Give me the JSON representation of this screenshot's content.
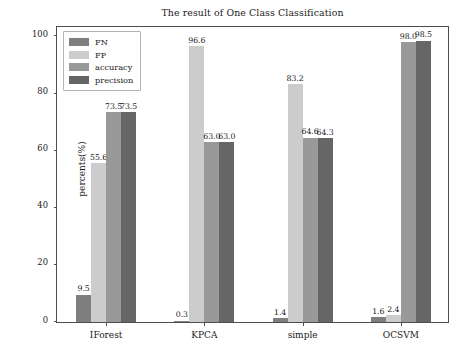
{
  "chart_data": {
    "type": "bar",
    "title": "The result of One Class Classification",
    "xlabel": "",
    "ylabel": "percents(%)",
    "categories": [
      "IForest",
      "KPCA",
      "simple",
      "OCSVM"
    ],
    "series": [
      {
        "name": "FN",
        "color": "#7f7f7f",
        "values": [
          9.5,
          0.3,
          1.4,
          1.6
        ]
      },
      {
        "name": "FP",
        "color": "#cccccc",
        "values": [
          55.6,
          96.6,
          83.2,
          2.4
        ]
      },
      {
        "name": "accuracy",
        "color": "#999999",
        "values": [
          73.5,
          63.0,
          64.6,
          98.0
        ]
      },
      {
        "name": "precision",
        "color": "#666666",
        "values": [
          73.5,
          63.0,
          64.3,
          98.5
        ]
      }
    ],
    "value_labels": [
      [
        "9.5",
        "55.6",
        "73.5",
        "73.5"
      ],
      [
        "0.3",
        "96.6",
        "63.0",
        "63.0"
      ],
      [
        "1.4",
        "83.2",
        "64.6",
        "64.3"
      ],
      [
        "1.6",
        "2.4",
        "98.0",
        "98.5"
      ]
    ],
    "ylim": [
      0,
      104
    ],
    "yticks": [
      0,
      20,
      40,
      60,
      80,
      100
    ],
    "ytick_labels": [
      "0",
      "20",
      "40",
      "60",
      "80",
      "100"
    ],
    "grid": false,
    "legend_position": "upper left"
  },
  "legend": {
    "items": [
      {
        "label": "FN"
      },
      {
        "label": "FP"
      },
      {
        "label": "accuracy"
      },
      {
        "label": "precision"
      }
    ]
  }
}
